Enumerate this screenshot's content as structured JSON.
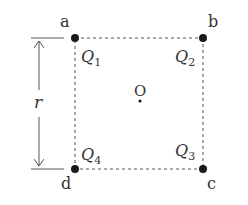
{
  "diagram": {
    "type": "square-of-charges",
    "corners": [
      {
        "id": "a",
        "label": "a",
        "charge": "Q",
        "sub": "1"
      },
      {
        "id": "b",
        "label": "b",
        "charge": "Q",
        "sub": "2"
      },
      {
        "id": "c",
        "label": "c",
        "charge": "Q",
        "sub": "3"
      },
      {
        "id": "d",
        "label": "d",
        "charge": "Q",
        "sub": "4"
      }
    ],
    "center": {
      "label": "O"
    },
    "dimension": {
      "label": "r"
    },
    "colors": {
      "line": "#444444",
      "point": "#1a1a1a",
      "text": "#333333"
    }
  }
}
